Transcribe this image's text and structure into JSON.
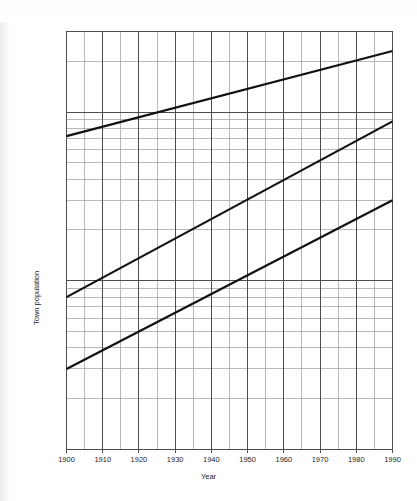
{
  "figure": {
    "background": "#ffffff",
    "ink_color": "#1c1c1c",
    "grid_major_color": "#4d4d4d",
    "grid_minor_color": "#9a9a9a",
    "series_color": "#111111"
  },
  "chart_data": {
    "type": "line",
    "title": "",
    "subtitle": "",
    "xlabel": "Year",
    "ylabel": "Town population",
    "xlim": [
      1900,
      1990
    ],
    "ylim": [
      1000,
      300000
    ],
    "yscale": "log",
    "xscale": "linear",
    "grid": "semi-log graph paper: major decade gridlines plus log minor gridlines on y, 10-year major and 5-year minor gridlines on x",
    "legend": "none",
    "x_ticks": [
      1900,
      1910,
      1920,
      1930,
      1940,
      1950,
      1960,
      1970,
      1980,
      1990
    ],
    "x_tick_labels": [
      "1900",
      "1910",
      "1920",
      "1930",
      "1940",
      "1950",
      "1960",
      "1970",
      "1980",
      "1990"
    ],
    "x_minor_step": 5,
    "y_ticks": [
      1000,
      10000,
      100000
    ],
    "y_tick_labels": [
      "1,000",
      "10,000",
      "100,000"
    ],
    "x": [
      1900,
      1990
    ],
    "series": [
      {
        "name": "Upper line",
        "values": [
          72000,
          230000
        ],
        "x": [
          1900,
          1990
        ],
        "linewidth": 2.2,
        "color": "#111111"
      },
      {
        "name": "Middle line",
        "values": [
          8000,
          88000
        ],
        "x": [
          1900,
          1990
        ],
        "linewidth": 2.2,
        "color": "#111111"
      },
      {
        "name": "Lower line",
        "values": [
          3000,
          30000
        ],
        "x": [
          1900,
          1990
        ],
        "linewidth": 2.2,
        "color": "#111111"
      }
    ],
    "annotations": []
  }
}
